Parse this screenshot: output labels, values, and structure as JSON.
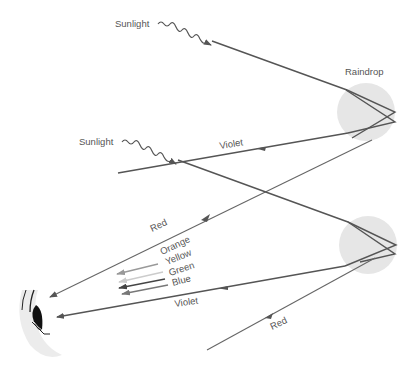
{
  "diagram": {
    "labels": {
      "sunlight_top": "Sunlight",
      "sunlight_bottom": "Sunlight",
      "raindrop": "Raindrop",
      "violet_top": "Violet",
      "red_top": "Red",
      "orange": "Orange",
      "yellow": "Yellow",
      "green": "Green",
      "blue": "Blue",
      "violet_bottom": "Violet",
      "red_bottom": "Red"
    },
    "colors": {
      "ray": "#555555",
      "raindrop_fill": "#e6e6e6",
      "orange_arrow": "#999999",
      "yellow_arrow": "#cccccc",
      "green_arrow": "#444444",
      "blue_arrow": "#777777",
      "text": "#555555"
    },
    "elements": [
      {
        "type": "raindrop",
        "position": "upper-right"
      },
      {
        "type": "raindrop",
        "position": "lower-right"
      },
      {
        "type": "eye",
        "position": "lower-left"
      }
    ]
  }
}
